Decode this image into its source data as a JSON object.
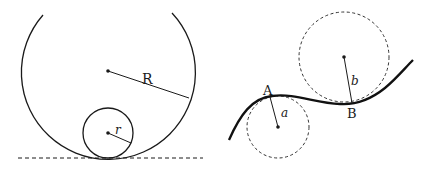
{
  "diagram": {
    "left_figure": {
      "large_circle": {
        "label": "R",
        "cx": 108,
        "cy": 71,
        "r": 87
      },
      "small_circle": {
        "label": "r",
        "cx": 108,
        "cy": 133,
        "r": 25
      },
      "tangent_line": {
        "style": "dashed",
        "y": 158,
        "x1": 18,
        "x2": 203
      }
    },
    "right_figure": {
      "curve": {
        "style": "solid-thick"
      },
      "point_A": {
        "label": "A",
        "x": 269,
        "y": 96
      },
      "point_B": {
        "label": "B",
        "x": 352,
        "y": 103
      },
      "circle_a": {
        "label": "a",
        "cx": 278,
        "cy": 127,
        "r": 31,
        "style": "dashed"
      },
      "circle_b": {
        "label": "b",
        "cx": 344,
        "cy": 57,
        "r": 45,
        "style": "dashed"
      }
    },
    "colors": {
      "stroke": "#1a1a1a",
      "background": "#ffffff"
    }
  }
}
